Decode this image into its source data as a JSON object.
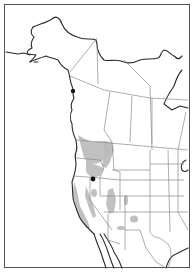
{
  "map": {
    "region": "Western North America",
    "type": "species range map",
    "colors": {
      "background": "#ffffff",
      "coastline": "#2a2a2a",
      "political_borders": "#8a8a8a",
      "range_fill": "#b9b9b9",
      "record_dot": "#111111"
    },
    "legend": {
      "shaded": "range",
      "dot": "isolated record"
    },
    "records": [
      {
        "name": "southeast-alaska-record",
        "x": 73,
        "y": 91
      },
      {
        "name": "oregon-idaho-border-record",
        "x": 93,
        "y": 179
      }
    ]
  }
}
